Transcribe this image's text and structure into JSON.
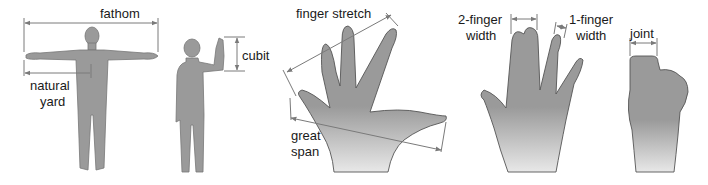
{
  "colors": {
    "figure_fill": "#9a9a9a",
    "figure_stroke": "#6b6b6b",
    "arrow": "#7a7a7a",
    "text": "#1a1a1a",
    "background": "#ffffff"
  },
  "labels": {
    "fathom": "fathom",
    "natural_yard_1": "natural",
    "natural_yard_2": "yard",
    "cubit": "cubit",
    "finger_stretch": "finger stretch",
    "great_span_1": "great",
    "great_span_2": "span",
    "two_finger_1": "2-finger",
    "two_finger_2": "width",
    "one_finger_1": "1-finger",
    "one_finger_2": "width",
    "joint": "joint"
  }
}
